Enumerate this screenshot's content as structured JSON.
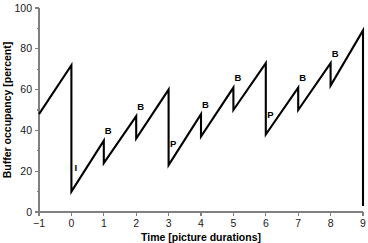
{
  "chart_data": {
    "type": "line",
    "title": "",
    "xlabel": "Time [picture durations]",
    "ylabel": "Buffer occupancy [percent]",
    "xlim": [
      -1,
      9
    ],
    "ylim": [
      0,
      100
    ],
    "grid": false,
    "legend": null,
    "x_ticks": [
      -1,
      0,
      1,
      2,
      3,
      4,
      5,
      6,
      7,
      8,
      9
    ],
    "x_tick_labels": [
      "−1",
      "0",
      "1",
      "2",
      "3",
      "4",
      "5",
      "6",
      "7",
      "8",
      "9"
    ],
    "y_ticks": [
      0,
      20,
      40,
      60,
      80,
      100
    ],
    "y_tick_labels": [
      "0",
      "20",
      "40",
      "60",
      "80",
      "100"
    ],
    "y_minor_ticks": [
      10,
      30,
      50,
      70,
      90
    ],
    "line_color": "#000000",
    "axis_color": "#808080",
    "points": [
      {
        "x": -1.0,
        "y": 48
      },
      {
        "x": 0.0,
        "y": 72
      },
      {
        "x": 0.0,
        "y": 10
      },
      {
        "x": 1.0,
        "y": 35
      },
      {
        "x": 1.0,
        "y": 24
      },
      {
        "x": 2.0,
        "y": 47
      },
      {
        "x": 2.0,
        "y": 36
      },
      {
        "x": 3.0,
        "y": 60
      },
      {
        "x": 3.0,
        "y": 23
      },
      {
        "x": 4.0,
        "y": 48
      },
      {
        "x": 4.0,
        "y": 37
      },
      {
        "x": 5.0,
        "y": 61
      },
      {
        "x": 5.0,
        "y": 50
      },
      {
        "x": 6.0,
        "y": 73
      },
      {
        "x": 6.0,
        "y": 38
      },
      {
        "x": 7.0,
        "y": 61
      },
      {
        "x": 7.0,
        "y": 50
      },
      {
        "x": 8.0,
        "y": 73
      },
      {
        "x": 8.0,
        "y": 62
      },
      {
        "x": 9.0,
        "y": 89
      },
      {
        "x": 9.0,
        "y": 3
      }
    ],
    "drop_events": [
      {
        "x": 0.0,
        "y_top": 72,
        "y_bottom": 10,
        "label": "I",
        "label_x": 0.0,
        "label_y": 20
      },
      {
        "x": 1.0,
        "y_top": 35,
        "y_bottom": 24,
        "label": "B",
        "label_x": 1.0,
        "label_y": 38
      },
      {
        "x": 2.0,
        "y_top": 47,
        "y_bottom": 36,
        "label": "B",
        "label_x": 2.0,
        "label_y": 50
      },
      {
        "x": 3.0,
        "y_top": 60,
        "y_bottom": 23,
        "label": "P",
        "label_x": 3.0,
        "label_y": 32
      },
      {
        "x": 4.0,
        "y_top": 48,
        "y_bottom": 37,
        "label": "B",
        "label_x": 4.0,
        "label_y": 51
      },
      {
        "x": 5.0,
        "y_top": 61,
        "y_bottom": 50,
        "label": "B",
        "label_x": 5.0,
        "label_y": 64
      },
      {
        "x": 6.0,
        "y_top": 73,
        "y_bottom": 38,
        "label": "P",
        "label_x": 6.0,
        "label_y": 46
      },
      {
        "x": 7.0,
        "y_top": 61,
        "y_bottom": 50,
        "label": "B",
        "label_x": 7.0,
        "label_y": 64
      },
      {
        "x": 8.0,
        "y_top": 73,
        "y_bottom": 62,
        "label": "B",
        "label_x": 8.0,
        "label_y": 76
      },
      {
        "x": 9.0,
        "y_top": 89,
        "y_bottom": 3,
        "label": "",
        "label_x": 9.0,
        "label_y": 0
      }
    ]
  }
}
